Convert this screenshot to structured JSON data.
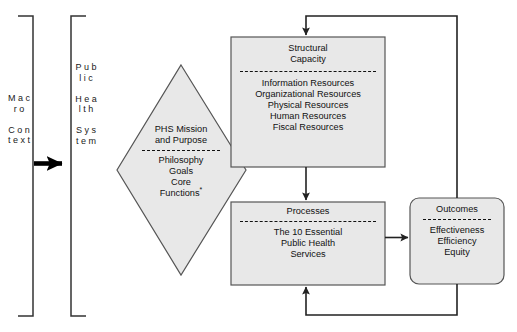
{
  "diagram": {
    "colors": {
      "node_fill": "#e8e8e8",
      "node_stroke": "#4d4d4d",
      "line": "#222222",
      "text": "#111111",
      "background": "#ffffff"
    },
    "brackets": [
      {
        "name": "macro-context",
        "label": "M a c r o\n\nC o n t e x t",
        "orientation": "opens-left"
      },
      {
        "name": "public-health-system",
        "label": "P u b l i c\n\nH e a l t h\n\nS y s t e m",
        "orientation": "opens-right"
      }
    ],
    "nodes": [
      {
        "id": "phs-mission",
        "shape": "diamond",
        "title": "PHS Mission\nand Purpose",
        "divider": true,
        "body": "Philosophy\nGoals\nCore\nFunctions",
        "body_superscript": "*"
      },
      {
        "id": "structural-capacity",
        "shape": "rect",
        "title": "Structural\nCapacity",
        "divider": true,
        "body": "Information Resources\nOrganizational Resources\nPhysical Resources\nHuman Resources\nFiscal Resources"
      },
      {
        "id": "processes",
        "shape": "rect",
        "title": "Processes",
        "divider": true,
        "body": "The 10 Essential\nPublic Health\nServices"
      },
      {
        "id": "outcomes",
        "shape": "rounded-rect",
        "title": "Outcomes",
        "divider": true,
        "body": "Effectiveness\nEfficiency\nEquity"
      }
    ],
    "connectors": [
      {
        "name": "macro-to-system-arrow",
        "from": "macro-context",
        "to": "public-health-system",
        "style": "thick-solid-arrow"
      },
      {
        "name": "capacity-to-processes-arrow",
        "from": "structural-capacity",
        "to": "processes",
        "style": "solid-arrow"
      },
      {
        "name": "processes-to-outcomes-arrow",
        "from": "processes",
        "to": "outcomes",
        "style": "solid-arrow"
      },
      {
        "name": "outcomes-to-capacity-feedback",
        "from": "outcomes",
        "to": "structural-capacity",
        "style": "solid-arrow-loop-top"
      },
      {
        "name": "outcomes-to-processes-feedback",
        "from": "outcomes",
        "to": "processes",
        "style": "solid-arrow-loop-bottom"
      }
    ]
  }
}
